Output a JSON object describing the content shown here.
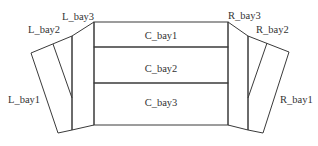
{
  "diagram": {
    "title": "",
    "line_color": "#3a3a3a",
    "text_color": "#333333",
    "center": {
      "bays": [
        {
          "id": "C_bay1",
          "label": "C_bay1"
        },
        {
          "id": "C_bay2",
          "label": "C_bay2"
        },
        {
          "id": "C_bay3",
          "label": "C_bay3"
        }
      ]
    },
    "left": {
      "bays": [
        {
          "id": "L_bay1",
          "label": "L_bay1"
        },
        {
          "id": "L_bay2",
          "label": "L_bay2"
        },
        {
          "id": "L_bay3",
          "label": "L_bay3"
        }
      ]
    },
    "right": {
      "bays": [
        {
          "id": "R_bay1",
          "label": "R_bay1"
        },
        {
          "id": "R_bay2",
          "label": "R_bay2"
        },
        {
          "id": "R_bay3",
          "label": "R_bay3"
        }
      ]
    }
  }
}
